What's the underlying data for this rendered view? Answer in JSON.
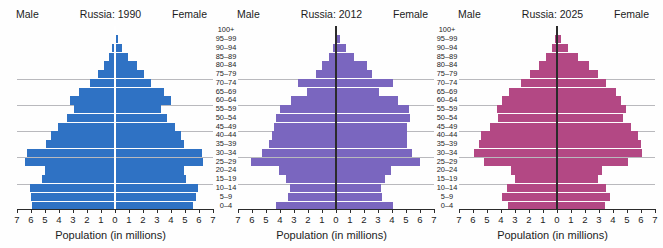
{
  "figure": {
    "axis_title": "Population (in millions)",
    "male_label": "Male",
    "female_label": "Female",
    "age_groups": [
      "100+",
      "95–99",
      "90–94",
      "85–89",
      "80–84",
      "75–79",
      "70–74",
      "65–69",
      "60–64",
      "55–59",
      "50–54",
      "45–49",
      "40–44",
      "35–39",
      "30–34",
      "25–29",
      "20–24",
      "15–19",
      "10–14",
      "5–9",
      "0–4"
    ],
    "x_ticks": [
      "7",
      "6",
      "5",
      "4",
      "3",
      "2",
      "1",
      "0",
      "1",
      "2",
      "3",
      "4",
      "5",
      "6",
      "7"
    ]
  },
  "panels": [
    {
      "title": "Russia: 1990",
      "male_label": "Male",
      "female_label": "Female",
      "axis_title": "Population (in millions)",
      "color": "#2f72c4"
    },
    {
      "title": "Russia: 2012",
      "male_label": "Male",
      "female_label": "Female",
      "axis_title": "Population (in millions)",
      "color": "#7a66bf"
    },
    {
      "title": "Russia: 2025",
      "male_label": "Male",
      "female_label": "Female",
      "axis_title": "Population (in millions)",
      "color": "#b34884"
    }
  ],
  "chart_data": [
    {
      "type": "bar",
      "title": "Russia: 1990",
      "subtitle": "",
      "xlabel": "Population (in millions)",
      "ylabel": "",
      "xlim": [
        -7,
        7
      ],
      "grid": true,
      "legend": [
        "Male",
        "Female"
      ],
      "legend_position": "top-left / top-right",
      "categories": [
        "100+",
        "95–99",
        "90–94",
        "85–89",
        "80–84",
        "75–79",
        "70–74",
        "65–69",
        "60–64",
        "55–59",
        "50–54",
        "45–49",
        "40–44",
        "35–39",
        "30–34",
        "25–29",
        "20–24",
        "15–19",
        "10–14",
        "5–9",
        "0–4"
      ],
      "series": [
        {
          "name": "Male",
          "side": "left",
          "values": [
            0.02,
            0.08,
            0.2,
            0.4,
            0.8,
            1.2,
            1.8,
            2.6,
            3.2,
            2.9,
            3.4,
            4.1,
            4.6,
            4.9,
            6.3,
            6.4,
            5.0,
            5.2,
            6.1,
            6.0,
            5.9
          ]
        },
        {
          "name": "Female",
          "side": "right",
          "values": [
            0.05,
            0.2,
            0.5,
            0.9,
            1.6,
            2.1,
            2.6,
            3.5,
            4.0,
            3.3,
            3.7,
            4.3,
            4.7,
            4.9,
            6.2,
            6.3,
            4.9,
            5.1,
            5.9,
            5.8,
            5.6
          ]
        }
      ]
    },
    {
      "type": "bar",
      "title": "Russia: 2012",
      "subtitle": "",
      "xlabel": "Population (in millions)",
      "ylabel": "",
      "xlim": [
        -7,
        7
      ],
      "grid": true,
      "legend": [
        "Male",
        "Female"
      ],
      "legend_position": "top-left / top-right",
      "categories": [
        "100+",
        "95–99",
        "90–94",
        "85–89",
        "80–84",
        "75–79",
        "70–74",
        "65–69",
        "60–64",
        "55–59",
        "50–54",
        "45–49",
        "40–44",
        "35–39",
        "30–34",
        "25–29",
        "20–24",
        "15–19",
        "10–14",
        "5–9",
        "0–4"
      ],
      "series": [
        {
          "name": "Male",
          "side": "left",
          "values": [
            0.02,
            0.1,
            0.25,
            0.5,
            1.0,
            1.4,
            2.7,
            2.1,
            3.2,
            4.0,
            4.3,
            4.4,
            4.6,
            4.8,
            5.3,
            6.1,
            4.1,
            3.6,
            3.3,
            3.4,
            4.3
          ]
        },
        {
          "name": "Female",
          "side": "right",
          "values": [
            0.05,
            0.25,
            0.7,
            1.3,
            2.2,
            2.6,
            4.1,
            3.1,
            4.4,
            5.2,
            5.3,
            5.1,
            5.1,
            5.1,
            5.4,
            6.0,
            3.9,
            3.5,
            3.2,
            3.3,
            4.1
          ]
        }
      ]
    },
    {
      "type": "bar",
      "title": "Russia: 2025",
      "subtitle": "",
      "xlabel": "Population (in millions)",
      "ylabel": "",
      "xlim": [
        -7,
        7
      ],
      "grid": true,
      "legend": [
        "Male",
        "Female"
      ],
      "legend_position": "top-left / top-right",
      "categories": [
        "100+",
        "95–99",
        "90–94",
        "85–89",
        "80–84",
        "75–79",
        "70–74",
        "65–69",
        "60–64",
        "55–59",
        "50–54",
        "45–49",
        "40–44",
        "35–39",
        "30–34",
        "25–29",
        "20–24",
        "15–19",
        "10–14",
        "5–9",
        "0–4"
      ],
      "series": [
        {
          "name": "Male",
          "side": "left",
          "values": [
            0.03,
            0.12,
            0.35,
            0.8,
            1.3,
            1.9,
            2.6,
            3.4,
            3.9,
            4.3,
            4.2,
            4.8,
            5.4,
            5.6,
            5.9,
            5.2,
            3.3,
            3.0,
            3.6,
            3.9,
            3.5
          ]
        },
        {
          "name": "Female",
          "side": "right",
          "values": [
            0.08,
            0.3,
            0.8,
            1.5,
            2.3,
            2.9,
            3.5,
            4.2,
            4.6,
            4.9,
            4.7,
            5.3,
            5.8,
            6.0,
            6.1,
            5.1,
            3.2,
            2.9,
            3.5,
            3.8,
            3.4
          ]
        }
      ]
    }
  ]
}
